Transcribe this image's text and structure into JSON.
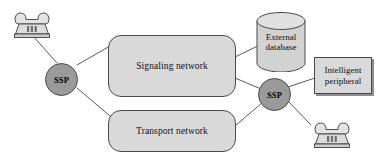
{
  "diagram": {
    "background_color": "#ffffff",
    "shape_fill": "#d9d9d9",
    "circle_fill": "#9a9a9a",
    "stroke_color": "#4a4a4a",
    "text_color": "#111111"
  },
  "nodes": {
    "phone_left": {
      "label": "telephone",
      "icon": "desk-telephone-icon"
    },
    "ssp_left": {
      "label": "SSP"
    },
    "signaling_network": {
      "label": "Signaling network"
    },
    "transport_network": {
      "label": "Transport network"
    },
    "external_database": {
      "label_line1": "External",
      "label_line2": "database"
    },
    "ssp_right": {
      "label": "SSP"
    },
    "intelligent_peripheral": {
      "label_line1": "Intelligent",
      "label_line2": "peripheral"
    },
    "phone_right": {
      "label": "telephone",
      "icon": "desk-telephone-icon"
    }
  },
  "edges": [
    {
      "from": "phone_left",
      "to": "ssp_left"
    },
    {
      "from": "ssp_left",
      "to": "signaling_network"
    },
    {
      "from": "ssp_left",
      "to": "transport_network"
    },
    {
      "from": "signaling_network",
      "to": "external_database"
    },
    {
      "from": "signaling_network",
      "to": "ssp_right"
    },
    {
      "from": "transport_network",
      "to": "ssp_right"
    },
    {
      "from": "ssp_right",
      "to": "intelligent_peripheral"
    },
    {
      "from": "ssp_right",
      "to": "phone_right"
    }
  ]
}
